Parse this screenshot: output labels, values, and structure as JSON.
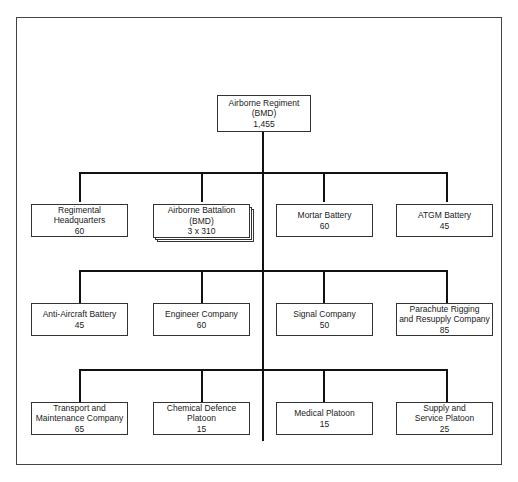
{
  "diagram": {
    "type": "org-chart",
    "root": {
      "name_lines": [
        "Airborne Regiment",
        "(BMD)"
      ],
      "strength": "1,455"
    },
    "rows": [
      {
        "units": [
          {
            "name_lines": [
              "Regimental",
              "Headquarters"
            ],
            "strength": "60"
          },
          {
            "name_lines": [
              "Airborne Battalion",
              "(BMD)"
            ],
            "strength": "3 x 310",
            "stacked": true
          },
          {
            "name_lines": [
              "Mortar Battery"
            ],
            "strength": "60"
          },
          {
            "name_lines": [
              "ATGM Battery"
            ],
            "strength": "45"
          }
        ]
      },
      {
        "units": [
          {
            "name_lines": [
              "Anti-Aircraft Battery"
            ],
            "strength": "45"
          },
          {
            "name_lines": [
              "Engineer Company"
            ],
            "strength": "60"
          },
          {
            "name_lines": [
              "Signal Company"
            ],
            "strength": "50"
          },
          {
            "name_lines": [
              "Parachute Rigging",
              "and Resupply Company"
            ],
            "strength": "85"
          }
        ]
      },
      {
        "units": [
          {
            "name_lines": [
              "Transport and",
              "Maintenance Company"
            ],
            "strength": "65"
          },
          {
            "name_lines": [
              "Chemical Defence",
              "Platoon"
            ],
            "strength": "15"
          },
          {
            "name_lines": [
              "Medical Platoon"
            ],
            "strength": "15"
          },
          {
            "name_lines": [
              "Supply and",
              "Service Platoon"
            ],
            "strength": "25"
          }
        ]
      }
    ]
  },
  "colors": {
    "line": "#111111",
    "box_border": "#333333",
    "background": "#ffffff"
  }
}
